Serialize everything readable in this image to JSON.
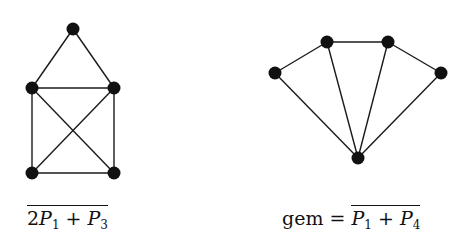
{
  "figure": {
    "graphs": [
      {
        "id": "left",
        "name": "complement of 2P1 + P3",
        "label": {
          "prefix": "",
          "overlined": {
            "coef": "2",
            "t1": "P",
            "s1": "1",
            "op": " + ",
            "t2": "P",
            "s2": "3"
          }
        },
        "nodes": [
          {
            "id": "top",
            "x": 73,
            "y": 29
          },
          {
            "id": "mid-left",
            "x": 32,
            "y": 88
          },
          {
            "id": "mid-right",
            "x": 114,
            "y": 88
          },
          {
            "id": "bottom-left",
            "x": 32,
            "y": 173
          },
          {
            "id": "bottom-right",
            "x": 114,
            "y": 173
          }
        ],
        "edges": [
          [
            "top",
            "mid-left"
          ],
          [
            "top",
            "mid-right"
          ],
          [
            "mid-left",
            "mid-right"
          ],
          [
            "mid-left",
            "bottom-left"
          ],
          [
            "mid-right",
            "bottom-right"
          ],
          [
            "bottom-left",
            "bottom-right"
          ],
          [
            "mid-left",
            "bottom-right"
          ],
          [
            "mid-right",
            "bottom-left"
          ]
        ]
      },
      {
        "id": "right",
        "name": "gem",
        "label": {
          "prefix": "gem = ",
          "overlined": {
            "coef": "",
            "t1": "P",
            "s1": "1",
            "op": " + ",
            "t2": "P",
            "s2": "4"
          }
        },
        "nodes": [
          {
            "id": "far-left",
            "x": 275,
            "y": 73
          },
          {
            "id": "top-left",
            "x": 327,
            "y": 42
          },
          {
            "id": "top-right",
            "x": 388,
            "y": 42
          },
          {
            "id": "far-right",
            "x": 441,
            "y": 73
          },
          {
            "id": "bottom",
            "x": 358,
            "y": 158
          }
        ],
        "edges": [
          [
            "far-left",
            "top-left"
          ],
          [
            "top-left",
            "top-right"
          ],
          [
            "top-right",
            "far-right"
          ],
          [
            "far-left",
            "bottom"
          ],
          [
            "top-left",
            "bottom"
          ],
          [
            "top-right",
            "bottom"
          ],
          [
            "far-right",
            "bottom"
          ]
        ]
      }
    ]
  },
  "style": {
    "node_color": "#111111",
    "edge_color": "#1a1a1a",
    "node_radius": 6.5
  }
}
